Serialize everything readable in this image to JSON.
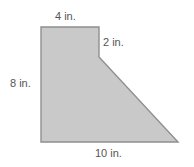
{
  "figure": {
    "name": "composite-polygon-with-dimension-labels",
    "shape_type": "right-trapezoid-composite",
    "fill_color": "#c9c9c9",
    "stroke_color": "#8f8f8f",
    "background_color": "#ffffff",
    "label_color": "#555555",
    "vertices": [
      [
        41,
        27
      ],
      [
        99,
        27
      ],
      [
        99,
        57
      ],
      [
        178,
        142
      ],
      [
        41,
        142
      ]
    ],
    "labels": {
      "top": "4 in.",
      "right": "2 in.",
      "left": "8 in.",
      "bottom": "10 in."
    }
  }
}
